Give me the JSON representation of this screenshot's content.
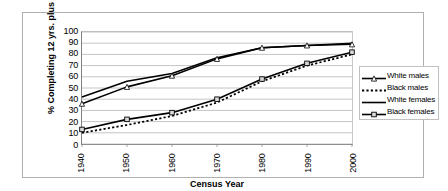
{
  "chart_data": {
    "type": "line",
    "title": "",
    "xlabel": "Census Year",
    "ylabel": "% Completing 12 yrs. plus",
    "x": [
      1940,
      1950,
      1960,
      1970,
      1980,
      1990,
      2000
    ],
    "categories": [
      "1940",
      "1950",
      "1960",
      "1970",
      "1980",
      "1990",
      "2000"
    ],
    "xlim": [
      1940,
      2000
    ],
    "ylim": [
      0,
      100
    ],
    "yticks": [
      0,
      10,
      20,
      30,
      40,
      50,
      60,
      70,
      80,
      90,
      100
    ],
    "grid": true,
    "legend_position": "right",
    "series": [
      {
        "name": "White males",
        "marker": "triangle",
        "line": "solid",
        "values": [
          36,
          51,
          61,
          76,
          86,
          88,
          89
        ]
      },
      {
        "name": "Black males",
        "marker": "none",
        "line": "dotted",
        "values": [
          10,
          17,
          25,
          37,
          56,
          70,
          80
        ]
      },
      {
        "name": "White females",
        "marker": "none",
        "line": "solid",
        "values": [
          42,
          56,
          63,
          77,
          86,
          88,
          90
        ]
      },
      {
        "name": "Black females",
        "marker": "square",
        "line": "solid",
        "values": [
          13,
          22,
          28,
          40,
          58,
          72,
          82
        ]
      }
    ]
  },
  "legend": {
    "items": [
      {
        "label": "White males"
      },
      {
        "label": "Black males"
      },
      {
        "label": "White females"
      },
      {
        "label": "Black females"
      }
    ]
  },
  "colors": {
    "line": "#000000",
    "grid": "#a9a9a9",
    "axis": "#808080",
    "frame": "#b0b0b0",
    "background": "#ffffff"
  }
}
